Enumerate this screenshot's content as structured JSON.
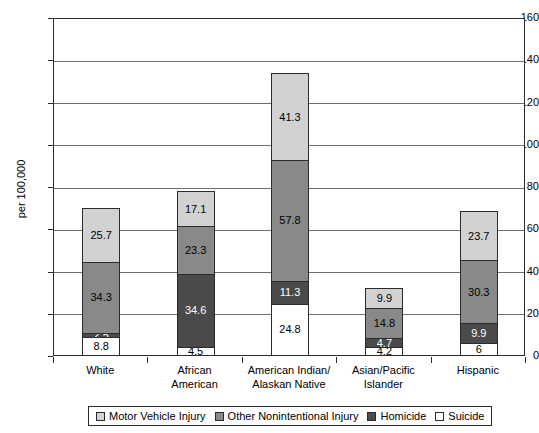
{
  "chart_data": {
    "type": "bar",
    "subtype": "stacked-bar",
    "title": "",
    "xlabel": "",
    "ylabel": "per 100,000",
    "ylim": [
      0,
      160
    ],
    "ytick_step": 20,
    "yticks": [
      0,
      20,
      40,
      60,
      80,
      100,
      120,
      140,
      160
    ],
    "ytick_labels": [
      "0",
      "20",
      "40",
      "60",
      "80",
      "100",
      "120",
      "140",
      "160"
    ],
    "grid": true,
    "legend_position": "bottom",
    "categories": [
      "White",
      "African American",
      "American Indian/ Alaskan Native",
      "Asian/Pacific Islander",
      "Hispanic"
    ],
    "category_lines": [
      [
        "White"
      ],
      [
        "African",
        "American"
      ],
      [
        "American Indian/",
        "Alaskan Native"
      ],
      [
        "Asian/Pacific",
        "Islander"
      ],
      [
        "Hispanic"
      ]
    ],
    "stack_order_bottom_to_top": [
      "Suicide",
      "Homicide",
      "Other Nonintentional Injury",
      "Motor Vehicle Injury"
    ],
    "series": [
      {
        "name": "Suicide",
        "key": "sui",
        "color": "#ffffff",
        "values": [
          8.8,
          4.5,
          24.8,
          4.2,
          6
        ],
        "labels": [
          "8.8",
          "4.5",
          "24.8",
          "4.2",
          "6"
        ]
      },
      {
        "name": "Homicide",
        "key": "hom",
        "color": "#4a4a4a",
        "values": [
          2.5,
          34.6,
          11.3,
          4.7,
          9.9
        ],
        "labels": [
          "2.5",
          "34.6",
          "11.3",
          "4.7",
          "9.9"
        ]
      },
      {
        "name": "Other Nonintentional Injury",
        "key": "other",
        "color": "#898989",
        "values": [
          34.3,
          23.3,
          57.8,
          14.8,
          30.3
        ],
        "labels": [
          "34.3",
          "23.3",
          "57.8",
          "14.8",
          "30.3"
        ]
      },
      {
        "name": "Motor Vehicle Injury",
        "key": "mv",
        "color": "#d2d2d2",
        "values": [
          25.7,
          17.1,
          41.3,
          9.9,
          23.7
        ],
        "labels": [
          "25.7",
          "17.1",
          "41.3",
          "9.9",
          "23.7"
        ]
      }
    ],
    "totals": [
      71.3,
      79.5,
      135.2,
      33.6,
      69.9
    ],
    "legend": [
      {
        "label": "Motor Vehicle Injury",
        "color": "#d2d2d2"
      },
      {
        "label": "Other Nonintentional Injury",
        "color": "#898989"
      },
      {
        "label": "Homicide",
        "color": "#4a4a4a"
      },
      {
        "label": "Suicide",
        "color": "#ffffff"
      }
    ]
  }
}
